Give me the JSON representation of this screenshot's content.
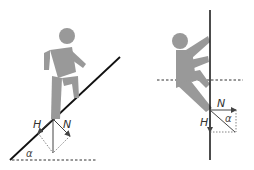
{
  "figure": {
    "panels": [
      {
        "id": "incline",
        "description": "Person walking up an inclined slope with force decomposition",
        "labels": {
          "horizontal_force": "H",
          "normal_force": "N",
          "angle": "α"
        }
      },
      {
        "id": "vertical-wall",
        "description": "Person climbing a vertical wall with force decomposition",
        "labels": {
          "horizontal_force": "N",
          "vertical_force": "H",
          "angle": "α"
        }
      }
    ]
  },
  "colors": {
    "figure": "#999999",
    "line": "#111111",
    "arrow": "#444444",
    "dashed": "#333333"
  }
}
